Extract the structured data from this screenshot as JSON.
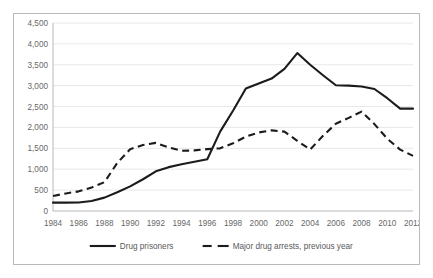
{
  "chart_data": {
    "type": "line",
    "title": "",
    "subtitle": "",
    "xlabel": "",
    "ylabel": "",
    "x": [
      1984,
      1985,
      1986,
      1987,
      1988,
      1989,
      1990,
      1991,
      1992,
      1993,
      1994,
      1995,
      1996,
      1997,
      1998,
      1999,
      2000,
      2001,
      2002,
      2003,
      2004,
      2005,
      2006,
      2007,
      2008,
      2009,
      2010,
      2011,
      2012
    ],
    "xtick_labels": [
      "1984",
      "1986",
      "1988",
      "1990",
      "1992",
      "1994",
      "1996",
      "1998",
      "2000",
      "2002",
      "2004",
      "2006",
      "2008",
      "2010",
      "2012"
    ],
    "xticks": [
      1984,
      1986,
      1988,
      1990,
      1992,
      1994,
      1996,
      1998,
      2000,
      2002,
      2004,
      2006,
      2008,
      2010,
      2012
    ],
    "ytick_labels": [
      "0",
      "500",
      "1,000",
      "1,500",
      "2,000",
      "2,500",
      "3,000",
      "3,500",
      "4,000",
      "4,500"
    ],
    "yticks": [
      0,
      500,
      1000,
      1500,
      2000,
      2500,
      3000,
      3500,
      4000,
      4500
    ],
    "ylim": [
      0,
      4500
    ],
    "xlim": [
      1984,
      2012
    ],
    "grid": true,
    "legend_position": "bottom",
    "series": [
      {
        "name": "Drug prisoners",
        "style": "solid",
        "color": "#1b1b1b",
        "values": [
          200,
          200,
          205,
          240,
          320,
          450,
          590,
          760,
          950,
          1050,
          1120,
          1180,
          1240,
          1900,
          2400,
          2930,
          3050,
          3170,
          3400,
          3780,
          3500,
          3250,
          3010,
          3000,
          2980,
          2920,
          2700,
          2450,
          2450
        ]
      },
      {
        "name": "Major drug arrests, previous year",
        "style": "dashed",
        "color": "#1b1b1b",
        "values": [
          360,
          420,
          470,
          560,
          690,
          1150,
          1480,
          1580,
          1630,
          1520,
          1440,
          1450,
          1480,
          1500,
          1620,
          1780,
          1880,
          1930,
          1900,
          1680,
          1470,
          1800,
          2090,
          2230,
          2380,
          2080,
          1730,
          1470,
          1320
        ]
      }
    ]
  },
  "legend": {
    "items": [
      {
        "label": "Drug prisoners",
        "style": "solid"
      },
      {
        "label": "Major drug arrests, previous year",
        "style": "dashed"
      }
    ]
  }
}
